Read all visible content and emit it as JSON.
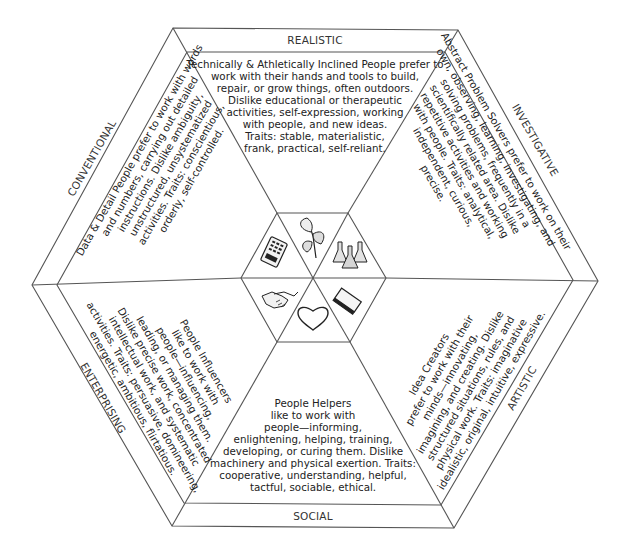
{
  "diagram": {
    "type": "RIASEC hexagon",
    "sections": [
      {
        "id": "realistic",
        "label": "REALISTIC",
        "icon": "plant-icon",
        "lines": [
          "Technically & Athletically Inclined People prefer to",
          "work with their hands and tools to build,",
          "repair, or grow things, often outdoors.",
          "Dislike educational or therapeutic",
          "activities, self-expression, working",
          "with people, and new ideas.",
          "Traits: stable, materialistic,",
          "frank, practical, self-reliant."
        ]
      },
      {
        "id": "investigative",
        "label": "INVESTIGATIVE",
        "icon": "flasks-icon",
        "lines": [
          "Abstract Problem Solvers prefer to work on their",
          "own, observing, learning, investigating, and",
          "solving problems, frequently in a",
          "scientifically related area. Dislike",
          "repetitive activities and working",
          "with people. Traits: analytical,",
          "independent, curious,",
          "precise."
        ]
      },
      {
        "id": "artistic",
        "label": "ARTISTIC",
        "icon": "book-icon",
        "lines": [
          "Idea Creators",
          "prefer to work with their",
          "minds—innovating,",
          "imagining, and creating. Dislike",
          "structured situations, rules, and",
          "physical work. Traits: imaginative",
          "idealistic, original, intuitive, expressive."
        ]
      },
      {
        "id": "social",
        "label": "SOCIAL",
        "icon": "heart-icon",
        "lines": [
          "People Helpers",
          "like to work with",
          "people—informing,",
          "enlightening, helping, training,",
          "developing, or curing them. Dislike",
          "machinery and physical exertion. Traits:",
          "cooperative, understanding, helpful,",
          "tactful, sociable, ethical."
        ]
      },
      {
        "id": "enterprising",
        "label": "ENTERPRISING",
        "icon": "handshake-icon",
        "lines": [
          "People Influencers",
          "like to work with",
          "people—influencing,",
          "leading, or managing them.",
          "Dislike precise work, concentrated",
          "intellectual work, and systematic",
          "activities. Traits: persuasive, domineering,",
          "energetic, ambitious, flirtatious."
        ]
      },
      {
        "id": "conventional",
        "label": "CONVENTIONAL",
        "icon": "calculator-icon",
        "lines": [
          "Data & Detail People prefer to work with words",
          "and numbers, carrying out detailed",
          "instructions. Dislike ambiguity,",
          "unstructured, unsystematized",
          "activities. Traits: conscientious,",
          "orderly, self-controlled."
        ]
      }
    ]
  }
}
